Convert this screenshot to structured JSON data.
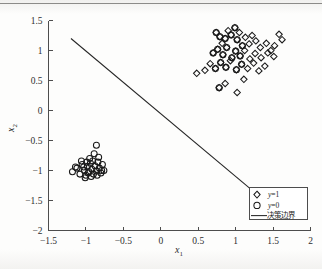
{
  "figure": {
    "kind": "scatter-plot",
    "background_color": "#fdfdfc",
    "axis_color": "#4d4d4d",
    "marker_color": "#1a1a1a",
    "boundary_color": "#262626"
  },
  "axes": {
    "xlabel": "x",
    "xlabel_sub": "1",
    "ylabel": "x",
    "ylabel_sub": "2",
    "xticklabels": [
      "-1.5",
      "-1",
      "-0.5",
      "0",
      "0.5",
      "1",
      "1.5",
      "2"
    ],
    "yticklabels": [
      "-2",
      "-1.5",
      "-1",
      "-0.5",
      "0",
      "0.5",
      "1",
      "1.5"
    ]
  },
  "legend": {
    "position": "bottom-right",
    "items": [
      {
        "label": "y=1",
        "label_var": "y",
        "label_rest": "=1",
        "marker": "diamond-marker"
      },
      {
        "label": "y=0",
        "label_var": "y",
        "label_rest": "=0",
        "marker": "circle-marker"
      },
      {
        "label": "决策边界",
        "marker": "line-marker"
      }
    ]
  },
  "chart_data": {
    "type": "scatter",
    "title": "",
    "xlabel": "x1",
    "ylabel": "x2",
    "xlim": [
      -1.5,
      2
    ],
    "ylim": [
      -2,
      1.5
    ],
    "xticks": [
      -1.5,
      -1,
      -0.5,
      0,
      0.5,
      1,
      1.5,
      2
    ],
    "yticks": [
      -2,
      -1.5,
      -1,
      -0.5,
      0,
      0.5,
      1,
      1.5
    ],
    "grid": false,
    "legend_position": "lower right",
    "series": [
      {
        "name": "y=1",
        "marker": "diamond",
        "points": [
          [
            0.74,
            1.3
          ],
          [
            0.79,
            1.23
          ],
          [
            0.82,
            1.12
          ],
          [
            0.86,
            1.2
          ],
          [
            0.9,
            1.33
          ],
          [
            0.94,
            1.26
          ],
          [
            0.99,
            1.38
          ],
          [
            1.02,
            1.18
          ],
          [
            1.05,
            1.3
          ],
          [
            1.09,
            1.08
          ],
          [
            1.13,
            1.22
          ],
          [
            1.18,
            1.11
          ],
          [
            1.22,
            1.25
          ],
          [
            1.27,
            1.16
          ],
          [
            1.33,
            1.05
          ],
          [
            1.41,
            1.12
          ],
          [
            1.47,
            1.0
          ],
          [
            1.52,
            1.08
          ],
          [
            1.58,
            1.27
          ],
          [
            1.62,
            1.18
          ],
          [
            0.7,
            0.96
          ],
          [
            0.76,
            1.02
          ],
          [
            0.83,
            0.93
          ],
          [
            0.88,
            1.05
          ],
          [
            0.95,
            0.88
          ],
          [
            1.0,
            0.99
          ],
          [
            1.06,
            0.91
          ],
          [
            1.12,
            1.0
          ],
          [
            1.19,
            0.86
          ],
          [
            1.26,
            0.95
          ],
          [
            1.34,
            0.88
          ],
          [
            1.43,
            0.96
          ],
          [
            1.51,
            0.9
          ],
          [
            0.66,
            0.78
          ],
          [
            0.73,
            0.7
          ],
          [
            0.8,
            0.8
          ],
          [
            0.87,
            0.72
          ],
          [
            0.93,
            0.83
          ],
          [
            1.01,
            0.68
          ],
          [
            1.08,
            0.77
          ],
          [
            1.16,
            0.7
          ],
          [
            1.24,
            0.79
          ],
          [
            1.31,
            0.66
          ],
          [
            1.39,
            0.74
          ],
          [
            0.48,
            0.62
          ],
          [
            0.59,
            0.67
          ],
          [
            1.02,
            0.3
          ],
          [
            1.11,
            0.52
          ],
          [
            0.86,
            0.45
          ],
          [
            0.78,
            0.38
          ]
        ]
      },
      {
        "name": "y=0",
        "marker": "circle",
        "points": [
          [
            -1.18,
            -1.02
          ],
          [
            -1.12,
            -0.96
          ],
          [
            -1.08,
            -1.06
          ],
          [
            -1.05,
            -0.9
          ],
          [
            -1.02,
            -1.0
          ],
          [
            -1.0,
            -1.08
          ],
          [
            -0.98,
            -0.93
          ],
          [
            -0.96,
            -1.02
          ],
          [
            -0.94,
            -0.88
          ],
          [
            -0.92,
            -0.98
          ],
          [
            -0.9,
            -1.06
          ],
          [
            -0.88,
            -0.92
          ],
          [
            -0.86,
            -1.01
          ],
          [
            -0.84,
            -0.86
          ],
          [
            -0.82,
            -0.96
          ],
          [
            -0.8,
            -1.04
          ],
          [
            -0.78,
            -0.9
          ],
          [
            -0.76,
            -1.0
          ],
          [
            -0.95,
            -0.8
          ],
          [
            -0.89,
            -0.72
          ],
          [
            -0.86,
            -0.58
          ],
          [
            -1.06,
            -0.84
          ],
          [
            -1.14,
            -0.94
          ],
          [
            -1.01,
            -1.12
          ],
          [
            -0.93,
            -1.1
          ],
          [
            -0.85,
            -1.08
          ],
          [
            -0.99,
            -0.86
          ],
          [
            -0.91,
            -0.84
          ],
          [
            -1.03,
            -0.94
          ],
          [
            -0.97,
            -1.04
          ],
          [
            -0.83,
            -0.78
          ],
          [
            -0.79,
            -1.0
          ],
          [
            0.74,
            1.3
          ],
          [
            0.79,
            1.23
          ],
          [
            0.86,
            1.2
          ],
          [
            0.94,
            1.26
          ],
          [
            0.99,
            1.38
          ],
          [
            1.02,
            1.18
          ],
          [
            1.09,
            1.08
          ],
          [
            0.76,
            1.02
          ],
          [
            0.83,
            0.93
          ],
          [
            0.88,
            1.05
          ],
          [
            0.95,
            0.88
          ],
          [
            1.0,
            0.99
          ],
          [
            1.06,
            0.91
          ],
          [
            0.73,
            0.7
          ],
          [
            0.8,
            0.8
          ],
          [
            0.87,
            0.72
          ],
          [
            1.01,
            0.68
          ],
          [
            1.08,
            0.77
          ],
          [
            0.78,
            0.38
          ],
          [
            0.7,
            0.96
          ]
        ]
      }
    ],
    "boundary_line": {
      "name": "决策边界",
      "x": [
        -1.2,
        1.27
      ],
      "y": [
        1.2,
        -1.38
      ]
    }
  }
}
